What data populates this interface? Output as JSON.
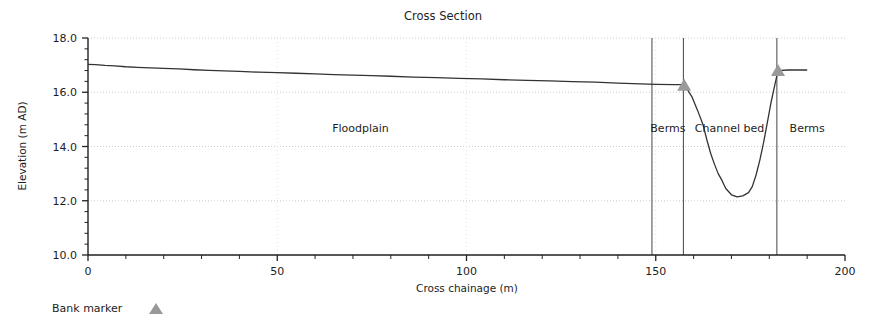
{
  "chart_data": {
    "type": "line",
    "title": "Cross Section",
    "xlabel": "Cross chainage (m)",
    "ylabel": "Elevation (m AD)",
    "xlim": [
      0,
      200
    ],
    "ylim": [
      10.0,
      18.0
    ],
    "xticks": [
      0,
      50,
      100,
      150,
      200
    ],
    "xtick_labels": [
      "0",
      "50",
      "100",
      "150",
      "200"
    ],
    "yticks": [
      10.0,
      12.0,
      14.0,
      16.0,
      18.0
    ],
    "ytick_labels": [
      "10.0",
      "12.0",
      "14.0",
      "16.0",
      "18.0"
    ],
    "xminor_step": 10,
    "yminor_step": 0.4,
    "grid": true,
    "grid_style": "dotted",
    "legend": {
      "position": "below-left",
      "entries": [
        {
          "label": "Bank marker",
          "marker": "triangle-up",
          "color": "#999999"
        }
      ]
    },
    "series": [
      {
        "name": "Ground profile",
        "color": "#333333",
        "points": [
          [
            0.0,
            17.03
          ],
          [
            2.0,
            17.02
          ],
          [
            4.5,
            16.99
          ],
          [
            7.0,
            16.97
          ],
          [
            10.0,
            16.94
          ],
          [
            13.0,
            16.92
          ],
          [
            16.5,
            16.9
          ],
          [
            20.0,
            16.88
          ],
          [
            24.0,
            16.86
          ],
          [
            28.0,
            16.83
          ],
          [
            32.0,
            16.81
          ],
          [
            36.0,
            16.79
          ],
          [
            40.0,
            16.77
          ],
          [
            45.0,
            16.74
          ],
          [
            50.0,
            16.72
          ],
          [
            55.0,
            16.7
          ],
          [
            60.0,
            16.68
          ],
          [
            65.0,
            16.65
          ],
          [
            70.0,
            16.63
          ],
          [
            75.0,
            16.61
          ],
          [
            80.0,
            16.59
          ],
          [
            86.0,
            16.56
          ],
          [
            92.0,
            16.54
          ],
          [
            98.0,
            16.51
          ],
          [
            104.0,
            16.49
          ],
          [
            110.0,
            16.46
          ],
          [
            116.0,
            16.44
          ],
          [
            122.0,
            16.42
          ],
          [
            128.0,
            16.39
          ],
          [
            134.0,
            16.37
          ],
          [
            140.0,
            16.34
          ],
          [
            146.0,
            16.31
          ],
          [
            150.0,
            16.29
          ],
          [
            155.0,
            16.28
          ],
          [
            157.5,
            16.28
          ],
          [
            159.5,
            15.85
          ],
          [
            161.0,
            15.35
          ],
          [
            162.5,
            14.8
          ],
          [
            163.5,
            14.25
          ],
          [
            164.5,
            13.75
          ],
          [
            165.5,
            13.35
          ],
          [
            166.5,
            13.0
          ],
          [
            167.5,
            12.75
          ],
          [
            168.5,
            12.45
          ],
          [
            170.0,
            12.22
          ],
          [
            171.5,
            12.14
          ],
          [
            173.0,
            12.18
          ],
          [
            174.5,
            12.3
          ],
          [
            175.5,
            12.52
          ],
          [
            176.5,
            12.95
          ],
          [
            177.5,
            13.5
          ],
          [
            178.5,
            14.15
          ],
          [
            179.5,
            14.9
          ],
          [
            180.5,
            15.65
          ],
          [
            181.5,
            16.3
          ],
          [
            182.3,
            16.8
          ],
          [
            185.0,
            16.82
          ],
          [
            190.0,
            16.82
          ]
        ]
      }
    ],
    "bank_markers": [
      {
        "x": 157.5,
        "y": 16.28,
        "label": "left-bank-marker"
      },
      {
        "x": 182.3,
        "y": 16.82,
        "label": "right-bank-marker"
      }
    ],
    "vertical_dividers": [
      {
        "x": 149.0,
        "name": "divider-floodplain-berms"
      },
      {
        "x": 157.3,
        "name": "divider-berms-channel"
      },
      {
        "x": 182.0,
        "name": "divider-channel-berms"
      }
    ],
    "annotations": [
      {
        "text": "Floodplain",
        "x": 72.0,
        "y": 14.55,
        "name": "annotation-floodplain"
      },
      {
        "text": "Berms",
        "x": 153.2,
        "y": 14.55,
        "name": "annotation-berms-left"
      },
      {
        "text": "Channel bed",
        "x": 169.5,
        "y": 14.55,
        "name": "annotation-channel-bed"
      },
      {
        "text": "Berms",
        "x": 190.0,
        "y": 14.55,
        "name": "annotation-berms-right"
      }
    ]
  }
}
